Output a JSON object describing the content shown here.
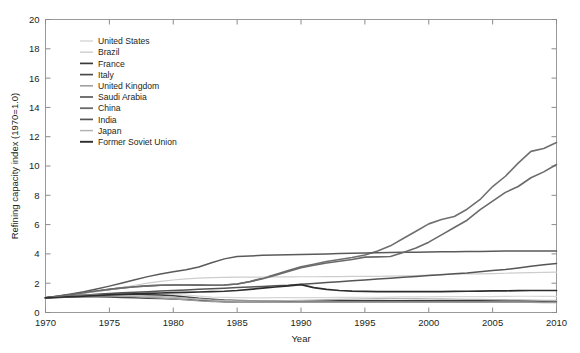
{
  "chart_data": {
    "type": "line",
    "title": "",
    "xlabel": "Year",
    "ylabel": "Refining capacity index (1970=1.0)",
    "xlim": [
      1970,
      2010
    ],
    "ylim": [
      0,
      20
    ],
    "xticks": [
      1970,
      1975,
      1980,
      1985,
      1990,
      1995,
      2000,
      2005,
      2010
    ],
    "yticks": [
      0,
      2,
      4,
      6,
      8,
      10,
      12,
      14,
      16,
      18,
      20
    ],
    "xtick_labels": [
      "1970",
      "1975",
      "1980",
      "1985",
      "1990",
      "1995",
      "2000",
      "2005",
      "2010"
    ],
    "ytick_labels": [
      "0",
      "2",
      "4",
      "6",
      "8",
      "10",
      "12",
      "14",
      "16",
      "18",
      "20"
    ],
    "grid": false,
    "legend_position": "upper-left-inside",
    "x": [
      1970,
      1971,
      1972,
      1973,
      1974,
      1975,
      1976,
      1977,
      1978,
      1979,
      1980,
      1981,
      1982,
      1983,
      1984,
      1985,
      1986,
      1987,
      1988,
      1989,
      1990,
      1991,
      1992,
      1993,
      1994,
      1995,
      1996,
      1997,
      1998,
      1999,
      2000,
      2001,
      2002,
      2003,
      2004,
      2005,
      2006,
      2007,
      2008,
      2009,
      2010
    ],
    "series": [
      {
        "name": "United States",
        "color": "#d6d6d6",
        "width": 1.2,
        "values": [
          1.0,
          1.02,
          1.04,
          1.07,
          1.1,
          1.12,
          1.15,
          1.19,
          1.21,
          1.23,
          1.22,
          1.19,
          1.12,
          1.05,
          1.03,
          1.01,
          1.0,
          1.0,
          1.01,
          1.01,
          1.02,
          1.02,
          1.02,
          1.03,
          1.03,
          1.04,
          1.04,
          1.05,
          1.06,
          1.06,
          1.07,
          1.08,
          1.08,
          1.08,
          1.09,
          1.09,
          1.1,
          1.11,
          1.11,
          1.1,
          1.1
        ]
      },
      {
        "name": "Brazil",
        "color": "#cdcdcd",
        "width": 1.2,
        "values": [
          1.0,
          1.08,
          1.18,
          1.3,
          1.42,
          1.55,
          1.7,
          1.86,
          2.0,
          2.12,
          2.22,
          2.3,
          2.35,
          2.38,
          2.4,
          2.41,
          2.42,
          2.42,
          2.43,
          2.43,
          2.44,
          2.44,
          2.45,
          2.45,
          2.46,
          2.46,
          2.47,
          2.48,
          2.5,
          2.52,
          2.56,
          2.6,
          2.62,
          2.63,
          2.64,
          2.66,
          2.68,
          2.7,
          2.72,
          2.74,
          2.76
        ]
      },
      {
        "name": "France",
        "color": "#3a3a3a",
        "width": 1.5,
        "values": [
          1.0,
          1.06,
          1.12,
          1.18,
          1.22,
          1.24,
          1.25,
          1.24,
          1.22,
          1.19,
          1.14,
          1.06,
          0.97,
          0.9,
          0.85,
          0.82,
          0.8,
          0.79,
          0.79,
          0.79,
          0.8,
          0.8,
          0.8,
          0.8,
          0.8,
          0.8,
          0.8,
          0.8,
          0.8,
          0.8,
          0.8,
          0.8,
          0.8,
          0.8,
          0.8,
          0.8,
          0.8,
          0.8,
          0.8,
          0.79,
          0.78
        ]
      },
      {
        "name": "Italy",
        "color": "#4a4a4a",
        "width": 1.5,
        "values": [
          1.0,
          1.03,
          1.05,
          1.07,
          1.07,
          1.05,
          1.03,
          1.0,
          0.97,
          0.95,
          0.92,
          0.88,
          0.83,
          0.78,
          0.74,
          0.71,
          0.7,
          0.7,
          0.7,
          0.7,
          0.7,
          0.7,
          0.7,
          0.7,
          0.7,
          0.7,
          0.7,
          0.7,
          0.7,
          0.7,
          0.7,
          0.7,
          0.7,
          0.7,
          0.7,
          0.7,
          0.7,
          0.7,
          0.7,
          0.7,
          0.7
        ]
      },
      {
        "name": "United Kingdom",
        "color": "#9a9a9a",
        "width": 1.3,
        "values": [
          1.0,
          1.04,
          1.08,
          1.12,
          1.14,
          1.14,
          1.12,
          1.08,
          1.03,
          0.99,
          0.94,
          0.87,
          0.8,
          0.75,
          0.72,
          0.7,
          0.69,
          0.69,
          0.69,
          0.69,
          0.7,
          0.7,
          0.7,
          0.7,
          0.7,
          0.7,
          0.7,
          0.7,
          0.7,
          0.7,
          0.7,
          0.7,
          0.7,
          0.7,
          0.7,
          0.7,
          0.7,
          0.7,
          0.69,
          0.68,
          0.67
        ]
      },
      {
        "name": "Saudi Arabia",
        "color": "#5a5a5a",
        "width": 1.5,
        "values": [
          1.0,
          1.12,
          1.26,
          1.42,
          1.6,
          1.8,
          2.02,
          2.24,
          2.45,
          2.63,
          2.78,
          2.92,
          3.1,
          3.4,
          3.66,
          3.82,
          3.86,
          3.9,
          3.92,
          3.94,
          3.96,
          3.98,
          4.0,
          4.02,
          4.04,
          4.06,
          4.08,
          4.1,
          4.11,
          4.12,
          4.13,
          4.14,
          4.15,
          4.16,
          4.17,
          4.18,
          4.19,
          4.2,
          4.2,
          4.2,
          4.2
        ]
      },
      {
        "name": "China",
        "color": "#6a6a6a",
        "width": 1.6,
        "values": [
          1.0,
          1.1,
          1.22,
          1.35,
          1.47,
          1.58,
          1.68,
          1.76,
          1.82,
          1.86,
          1.88,
          1.88,
          1.87,
          1.86,
          1.88,
          1.95,
          2.1,
          2.3,
          2.55,
          2.8,
          3.05,
          3.22,
          3.38,
          3.5,
          3.62,
          3.78,
          3.8,
          3.82,
          4.1,
          4.4,
          4.8,
          5.3,
          5.8,
          6.3,
          7.0,
          7.6,
          8.2,
          8.6,
          9.2,
          9.6,
          10.1
        ]
      },
      {
        "name": "India",
        "color": "#555555",
        "width": 1.5,
        "values": [
          1.0,
          1.06,
          1.12,
          1.18,
          1.24,
          1.3,
          1.34,
          1.38,
          1.42,
          1.46,
          1.5,
          1.54,
          1.58,
          1.62,
          1.66,
          1.7,
          1.74,
          1.78,
          1.82,
          1.86,
          1.92,
          1.98,
          2.04,
          2.1,
          2.16,
          2.22,
          2.28,
          2.34,
          2.4,
          2.46,
          2.52,
          2.58,
          2.64,
          2.7,
          2.78,
          2.86,
          2.94,
          3.04,
          3.16,
          3.26,
          3.34
        ]
      },
      {
        "name": "Japan",
        "color": "#b4b4b4",
        "width": 1.3,
        "values": [
          1.0,
          1.06,
          1.11,
          1.16,
          1.18,
          1.18,
          1.16,
          1.13,
          1.1,
          1.08,
          1.04,
          0.98,
          0.92,
          0.86,
          0.82,
          0.8,
          0.79,
          0.79,
          0.8,
          0.81,
          0.83,
          0.85,
          0.87,
          0.89,
          0.91,
          0.93,
          0.94,
          0.95,
          0.95,
          0.94,
          0.93,
          0.92,
          0.91,
          0.9,
          0.89,
          0.88,
          0.87,
          0.86,
          0.85,
          0.83,
          0.82
        ]
      },
      {
        "name": "Former Soviet Union",
        "color": "#2d2d2d",
        "width": 1.7,
        "values": [
          1.0,
          1.04,
          1.08,
          1.12,
          1.16,
          1.2,
          1.24,
          1.27,
          1.3,
          1.33,
          1.36,
          1.38,
          1.4,
          1.42,
          1.45,
          1.5,
          1.58,
          1.66,
          1.74,
          1.82,
          1.9,
          1.7,
          1.58,
          1.5,
          1.46,
          1.44,
          1.43,
          1.42,
          1.42,
          1.42,
          1.42,
          1.43,
          1.44,
          1.45,
          1.46,
          1.47,
          1.48,
          1.49,
          1.5,
          1.5,
          1.5
        ]
      }
    ],
    "alt_series": [
      {
        "name": "China-upper",
        "color": "#6f6f6f",
        "width": 1.6,
        "values": [
          1.0,
          1.1,
          1.22,
          1.35,
          1.47,
          1.58,
          1.68,
          1.76,
          1.82,
          1.86,
          1.88,
          1.88,
          1.87,
          1.86,
          1.88,
          1.95,
          2.12,
          2.34,
          2.6,
          2.86,
          3.12,
          3.3,
          3.48,
          3.62,
          3.76,
          3.92,
          4.2,
          4.55,
          5.05,
          5.55,
          6.05,
          6.35,
          6.55,
          7.05,
          7.7,
          8.6,
          9.3,
          10.2,
          11.0,
          11.2,
          11.6
        ]
      }
    ]
  },
  "legend": {
    "entries": [
      "United States",
      "Brazil",
      "France",
      "Italy",
      "United Kingdom",
      "Saudi Arabia",
      "China",
      "India",
      "Japan",
      "Former Soviet Union"
    ]
  }
}
